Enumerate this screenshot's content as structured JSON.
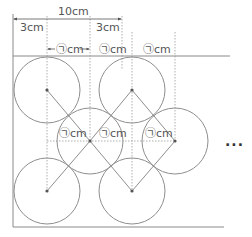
{
  "diagram": {
    "labels": {
      "total_width": "10cm",
      "left_margin": "3cm",
      "right_margin": "3cm",
      "unknown_unit": "㉠cm",
      "continuation": "..."
    },
    "top_labels": [
      "㉠cm",
      "㉠cm",
      "㉠cm"
    ],
    "middle_labels": [
      "㉠cm",
      "㉠cm",
      "㉠cm"
    ],
    "circles": [
      {
        "row": "top",
        "cx": 47,
        "cy": 90,
        "r": 33
      },
      {
        "row": "top",
        "cx": 132,
        "cy": 90,
        "r": 33
      },
      {
        "row": "middle",
        "cx": 90,
        "cy": 141,
        "r": 33
      },
      {
        "row": "middle",
        "cx": 175,
        "cy": 141,
        "r": 33
      },
      {
        "row": "bottom",
        "cx": 47,
        "cy": 191,
        "r": 33
      },
      {
        "row": "bottom",
        "cx": 132,
        "cy": 191,
        "r": 33
      }
    ],
    "colors": {
      "line": "#8a8a8a",
      "text": "#555555",
      "background": "#ffffff"
    }
  }
}
